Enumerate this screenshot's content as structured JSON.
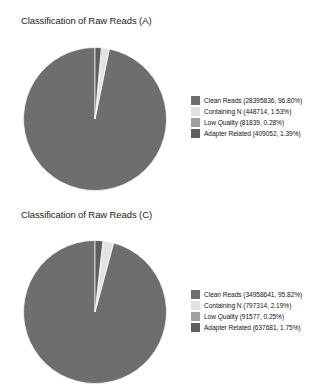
{
  "figures": [
    {
      "id": "A",
      "title": "Classification of Raw Reads (A)",
      "legend": [
        {
          "label": "Clean Reads (28395836, 96.80%)",
          "color": "#6e6e6e"
        },
        {
          "label": "Containing N (448714, 1.53%)",
          "color": "#e2e2e2"
        },
        {
          "label": "Low Quality (81839, 0.28%)",
          "color": "#a0a0a0"
        },
        {
          "label": "Adapter Related (409052, 1.39%)",
          "color": "#5e5e5e"
        }
      ]
    },
    {
      "id": "C",
      "title": "Classification of Raw Reads (C)",
      "legend": [
        {
          "label": "Clean Reads (34958641, 95.82%)",
          "color": "#6e6e6e"
        },
        {
          "label": "Containing N (797314, 2.19%)",
          "color": "#e2e2e2"
        },
        {
          "label": "Low Quality (91577, 0.25%)",
          "color": "#a0a0a0"
        },
        {
          "label": "Adapter Related (637681, 1.75%)",
          "color": "#5e5e5e"
        }
      ]
    }
  ],
  "chart_data": [
    {
      "type": "pie",
      "title": "Classification of Raw Reads (A)",
      "xlabel": "",
      "ylabel": "",
      "legend_position": "right",
      "startangle": 90,
      "counterclock": true,
      "categories": [
        "Clean Reads",
        "Containing N",
        "Low Quality",
        "Adapter Related"
      ],
      "values": [
        28395836,
        448714,
        81839,
        409052
      ],
      "percents": [
        96.8,
        1.53,
        0.28,
        1.39
      ],
      "colors": [
        "#6e6e6e",
        "#e2e2e2",
        "#a0a0a0",
        "#5e5e5e"
      ],
      "labels": [
        "Clean Reads (28395836, 96.80%)",
        "Containing N (448714, 1.53%)",
        "Low Quality (81839, 0.28%)",
        "Adapter Related (409052, 1.39%)"
      ]
    },
    {
      "type": "pie",
      "title": "Classification of Raw Reads (C)",
      "xlabel": "",
      "ylabel": "",
      "legend_position": "right",
      "startangle": 90,
      "counterclock": true,
      "categories": [
        "Clean Reads",
        "Containing N",
        "Low Quality",
        "Adapter Related"
      ],
      "values": [
        34958641,
        797314,
        91577,
        637681
      ],
      "percents": [
        95.82,
        2.19,
        0.25,
        1.75
      ],
      "colors": [
        "#6e6e6e",
        "#e2e2e2",
        "#a0a0a0",
        "#5e5e5e"
      ],
      "labels": [
        "Clean Reads (34958641, 95.82%)",
        "Containing N (797314, 2.19%)",
        "Low Quality (91577, 0.25%)",
        "Adapter Related (637681, 1.75%)"
      ]
    }
  ]
}
